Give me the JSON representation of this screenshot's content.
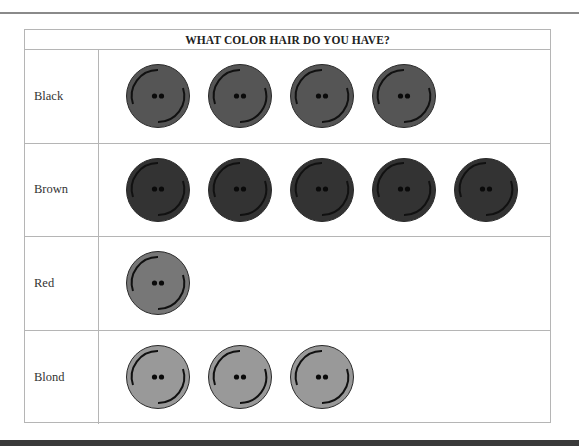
{
  "chart_data": {
    "type": "pictograph",
    "title": "WHAT COLOR HAIR DO YOU HAVE?",
    "categories": [
      "Black",
      "Brown",
      "Red",
      "Blond"
    ],
    "values": [
      4,
      5,
      1,
      3
    ],
    "icon": "button",
    "icon_colors": {
      "Black": "#555555",
      "Brown": "#333333",
      "Red": "#777777",
      "Blond": "#999999"
    },
    "xlabel": "",
    "ylabel": ""
  },
  "pictograph": {
    "title": "WHAT COLOR HAIR DO YOU HAVE?",
    "rows": [
      {
        "label": "Black",
        "count": 4,
        "color": "#555555"
      },
      {
        "label": "Brown",
        "count": 5,
        "color": "#333333"
      },
      {
        "label": "Red",
        "count": 1,
        "color": "#777777"
      },
      {
        "label": "Blond",
        "count": 3,
        "color": "#999999"
      }
    ]
  }
}
